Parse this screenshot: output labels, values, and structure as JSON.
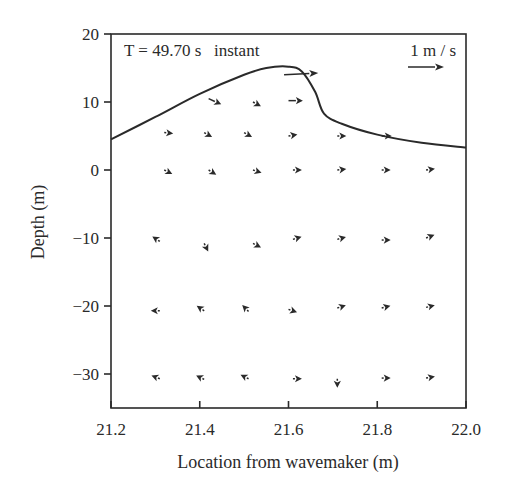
{
  "chart_data": {
    "type": "quiver",
    "title": "",
    "annotation": "T = 49.70 s   instant",
    "scale_label": "1 m / s",
    "scale_length_ms": 1,
    "xlabel": "Location from wavemaker (m)",
    "ylabel": "Depth (m)",
    "xlim": [
      21.2,
      22.0
    ],
    "ylim": [
      -35,
      20
    ],
    "xticks": [
      "21.2",
      "21.4",
      "21.6",
      "21.8",
      "22.0"
    ],
    "yticks": [
      "20",
      "10",
      "0",
      "−10",
      "−20",
      "−30"
    ],
    "grid": false,
    "free_surface": {
      "x": [
        21.2,
        21.3,
        21.4,
        21.5,
        21.55,
        21.6,
        21.63,
        21.66,
        21.68,
        21.72,
        21.8,
        21.9,
        22.0
      ],
      "y": [
        4.5,
        7.8,
        11.2,
        14.0,
        15.0,
        15.2,
        14.5,
        11.5,
        8.3,
        6.8,
        5.2,
        4.0,
        3.3
      ]
    },
    "vectors": [
      {
        "x": 21.59,
        "y": 14.0,
        "u": 0.95,
        "v": 0.05
      },
      {
        "x": 21.42,
        "y": 10.5,
        "u": 0.35,
        "v": -0.16
      },
      {
        "x": 21.52,
        "y": 10.0,
        "u": 0.22,
        "v": -0.12
      },
      {
        "x": 21.6,
        "y": 10.2,
        "u": 0.4,
        "v": 0.0
      },
      {
        "x": 21.32,
        "y": 5.5,
        "u": 0.22,
        "v": -0.02
      },
      {
        "x": 21.41,
        "y": 5.5,
        "u": 0.22,
        "v": -0.12
      },
      {
        "x": 21.5,
        "y": 5.5,
        "u": 0.22,
        "v": -0.12
      },
      {
        "x": 21.6,
        "y": 5.0,
        "u": 0.24,
        "v": 0.04
      },
      {
        "x": 21.71,
        "y": 5.0,
        "u": 0.24,
        "v": 0.0
      },
      {
        "x": 21.81,
        "y": 5.0,
        "u": 0.28,
        "v": 0.0
      },
      {
        "x": 21.32,
        "y": 0.0,
        "u": 0.16,
        "v": -0.08
      },
      {
        "x": 21.42,
        "y": 0.0,
        "u": 0.13,
        "v": -0.08
      },
      {
        "x": 21.52,
        "y": 0.0,
        "u": 0.15,
        "v": -0.05
      },
      {
        "x": 21.61,
        "y": 0.0,
        "u": 0.2,
        "v": 0.0
      },
      {
        "x": 21.71,
        "y": 0.0,
        "u": 0.2,
        "v": 0.02
      },
      {
        "x": 21.81,
        "y": 0.0,
        "u": 0.2,
        "v": 0.0
      },
      {
        "x": 21.91,
        "y": 0.0,
        "u": 0.2,
        "v": 0.03
      },
      {
        "x": 21.31,
        "y": -10.5,
        "u": -0.03,
        "v": 0.02
      },
      {
        "x": 21.41,
        "y": -10.8,
        "u": 0.02,
        "v": -0.04
      },
      {
        "x": 21.52,
        "y": -10.8,
        "u": 0.08,
        "v": -0.04
      },
      {
        "x": 21.61,
        "y": -10.2,
        "u": 0.1,
        "v": 0.03
      },
      {
        "x": 21.71,
        "y": -10.2,
        "u": 0.07,
        "v": 0.02
      },
      {
        "x": 21.81,
        "y": -10.3,
        "u": 0.07,
        "v": 0.0
      },
      {
        "x": 21.91,
        "y": -10.0,
        "u": 0.08,
        "v": 0.03
      },
      {
        "x": 21.31,
        "y": -20.7,
        "u": -0.05,
        "v": 0.0
      },
      {
        "x": 21.41,
        "y": -20.7,
        "u": -0.03,
        "v": 0.02
      },
      {
        "x": 21.51,
        "y": -20.8,
        "u": -0.02,
        "v": 0.02
      },
      {
        "x": 21.6,
        "y": -20.5,
        "u": 0.06,
        "v": -0.02
      },
      {
        "x": 21.71,
        "y": -20.3,
        "u": 0.06,
        "v": 0.02
      },
      {
        "x": 21.81,
        "y": -20.3,
        "u": 0.08,
        "v": 0.02
      },
      {
        "x": 21.91,
        "y": -20.2,
        "u": 0.08,
        "v": 0.02
      },
      {
        "x": 21.31,
        "y": -30.7,
        "u": -0.05,
        "v": 0.02
      },
      {
        "x": 21.41,
        "y": -30.8,
        "u": -0.04,
        "v": 0.02
      },
      {
        "x": 21.51,
        "y": -30.7,
        "u": -0.04,
        "v": 0.02
      },
      {
        "x": 21.61,
        "y": -30.7,
        "u": 0.06,
        "v": 0.0
      },
      {
        "x": 21.71,
        "y": -30.7,
        "u": 0.0,
        "v": -0.04
      },
      {
        "x": 21.81,
        "y": -30.6,
        "u": 0.06,
        "v": 0.0
      },
      {
        "x": 21.91,
        "y": -30.6,
        "u": 0.06,
        "v": 0.01
      }
    ],
    "legend": null,
    "legend_position": "none"
  }
}
